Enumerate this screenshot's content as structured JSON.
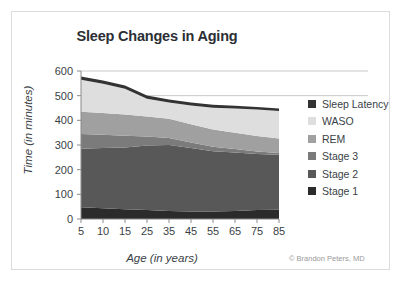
{
  "chart_data": {
    "type": "area",
    "title": "Sleep Changes in Aging",
    "xlabel": "Age (in years)",
    "ylabel": "Time (in minutes)",
    "categories": [
      "5",
      "10",
      "15",
      "25",
      "35",
      "45",
      "55",
      "65",
      "75",
      "85"
    ],
    "x": [
      5,
      10,
      15,
      25,
      35,
      45,
      55,
      65,
      75,
      85
    ],
    "ylim": [
      0,
      600
    ],
    "yticks": [
      0,
      100,
      200,
      300,
      400,
      500,
      600
    ],
    "grid": true,
    "stacked": true,
    "legend_position": "right",
    "credit": "© Brandon Peters, MD",
    "series": [
      {
        "name": "Stage 1",
        "color": "#2b2b2b",
        "values": [
          48,
          44,
          40,
          36,
          32,
          30,
          30,
          32,
          36,
          38
        ]
      },
      {
        "name": "Stage 2",
        "color": "#585858",
        "values": [
          237,
          244,
          250,
          262,
          268,
          258,
          245,
          238,
          228,
          222
        ]
      },
      {
        "name": "Stage 3",
        "color": "#7b7b7b",
        "values": [
          60,
          54,
          48,
          36,
          28,
          22,
          18,
          14,
          10,
          8
        ]
      },
      {
        "name": "REM",
        "color": "#a0a0a0",
        "values": [
          90,
          88,
          86,
          82,
          78,
          74,
          70,
          66,
          62,
          58
        ]
      },
      {
        "name": "WASO",
        "color": "#dedede",
        "values": [
          130,
          118,
          104,
          72,
          66,
          76,
          88,
          98,
          108,
          112
        ]
      },
      {
        "name": "Sleep Latency",
        "color": "#333333",
        "values": [
          13,
          13,
          13,
          13,
          12,
          12,
          12,
          11,
          10,
          10
        ]
      }
    ]
  },
  "legend": {
    "items": [
      {
        "label": "Sleep Latency",
        "color": "#333333"
      },
      {
        "label": "WASO",
        "color": "#dedede"
      },
      {
        "label": "REM",
        "color": "#a0a0a0"
      },
      {
        "label": "Stage 3",
        "color": "#7b7b7b"
      },
      {
        "label": "Stage 2",
        "color": "#585858"
      },
      {
        "label": "Stage 1",
        "color": "#2b2b2b"
      }
    ]
  }
}
